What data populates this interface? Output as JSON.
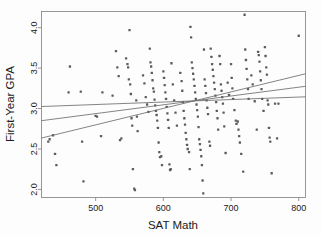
{
  "chart_data": {
    "type": "scatter",
    "title": "",
    "xlabel": "SAT Math",
    "ylabel": "First-Year GPA",
    "xlim": [
      420,
      810
    ],
    "ylim": [
      1.9,
      4.2
    ],
    "xticks": [
      500,
      600,
      700,
      800
    ],
    "yticks": [
      2.0,
      2.5,
      3.0,
      3.5,
      4.0
    ],
    "xtick_labels": [
      "500",
      "600",
      "700",
      "800"
    ],
    "ytick_labels": [
      "2.0",
      "2.5",
      "3.0",
      "3.5",
      "4.0"
    ],
    "grid": false,
    "legend": "none",
    "marker_color": "#5c5c5c",
    "line_color": "#6e6e6e",
    "frame_color": "#8c8c8c",
    "points": [
      [
        430,
        2.59
      ],
      [
        432,
        2.62
      ],
      [
        437,
        2.67
      ],
      [
        440,
        2.44
      ],
      [
        442,
        2.3
      ],
      [
        460,
        3.2
      ],
      [
        462,
        3.52
      ],
      [
        478,
        3.21
      ],
      [
        480,
        2.59
      ],
      [
        482,
        2.1
      ],
      [
        500,
        2.91
      ],
      [
        502,
        2.9
      ],
      [
        508,
        2.66
      ],
      [
        510,
        3.2
      ],
      [
        525,
        3.16
      ],
      [
        530,
        3.71
      ],
      [
        532,
        3.51
      ],
      [
        534,
        3.4
      ],
      [
        536,
        2.61
      ],
      [
        538,
        2.63
      ],
      [
        545,
        3.62
      ],
      [
        547,
        3.55
      ],
      [
        548,
        3.51
      ],
      [
        549,
        3.36
      ],
      [
        550,
        3.97
      ],
      [
        551,
        3.3
      ],
      [
        552,
        3.18
      ],
      [
        553,
        2.88
      ],
      [
        554,
        2.79
      ],
      [
        555,
        2.25
      ],
      [
        557,
        2.01
      ],
      [
        558,
        1.99
      ],
      [
        560,
        3.1
      ],
      [
        561,
        2.9
      ],
      [
        562,
        2.72
      ],
      [
        570,
        3.41
      ],
      [
        572,
        3.31
      ],
      [
        574,
        3.14
      ],
      [
        576,
        3.05
      ],
      [
        578,
        2.96
      ],
      [
        580,
        3.74
      ],
      [
        581,
        3.57
      ],
      [
        582,
        3.52
      ],
      [
        583,
        3.44
      ],
      [
        584,
        3.35
      ],
      [
        585,
        3.25
      ],
      [
        586,
        3.21
      ],
      [
        587,
        3.11
      ],
      [
        588,
        3.04
      ],
      [
        589,
        2.97
      ],
      [
        590,
        2.92
      ],
      [
        591,
        2.85
      ],
      [
        592,
        2.76
      ],
      [
        593,
        2.58
      ],
      [
        594,
        2.46
      ],
      [
        595,
        2.4
      ],
      [
        597,
        2.41
      ],
      [
        598,
        2.3
      ],
      [
        600,
        3.46
      ],
      [
        601,
        3.38
      ],
      [
        602,
        3.29
      ],
      [
        603,
        3.2
      ],
      [
        604,
        3.12
      ],
      [
        605,
        3.02
      ],
      [
        606,
        2.94
      ],
      [
        607,
        2.86
      ],
      [
        608,
        2.76
      ],
      [
        609,
        2.31
      ],
      [
        610,
        2.24
      ],
      [
        611,
        2.25
      ],
      [
        612,
        3.56
      ],
      [
        614,
        3.3
      ],
      [
        616,
        3.1
      ],
      [
        618,
        2.95
      ],
      [
        620,
        2.79
      ],
      [
        625,
        3.44
      ],
      [
        627,
        3.34
      ],
      [
        628,
        3.22
      ],
      [
        629,
        3.08
      ],
      [
        630,
        2.97
      ],
      [
        631,
        2.88
      ],
      [
        632,
        2.8
      ],
      [
        633,
        2.7
      ],
      [
        634,
        2.62
      ],
      [
        635,
        2.55
      ],
      [
        636,
        2.5
      ],
      [
        638,
        2.46
      ],
      [
        639,
        2.25
      ],
      [
        640,
        4.01
      ],
      [
        641,
        3.88
      ],
      [
        642,
        3.57
      ],
      [
        643,
        3.5
      ],
      [
        644,
        3.43
      ],
      [
        645,
        3.36
      ],
      [
        646,
        3.28
      ],
      [
        647,
        3.2
      ],
      [
        648,
        3.12
      ],
      [
        649,
        3.05
      ],
      [
        650,
        2.98
      ],
      [
        651,
        2.9
      ],
      [
        652,
        2.77
      ],
      [
        653,
        2.62
      ],
      [
        654,
        2.56
      ],
      [
        655,
        2.49
      ],
      [
        656,
        2.41
      ],
      [
        657,
        2.3
      ],
      [
        658,
        2.11
      ],
      [
        659,
        1.95
      ],
      [
        660,
        3.73
      ],
      [
        661,
        3.36
      ],
      [
        662,
        3.28
      ],
      [
        663,
        3.19
      ],
      [
        664,
        3.1
      ],
      [
        665,
        3.01
      ],
      [
        666,
        2.93
      ],
      [
        668,
        2.59
      ],
      [
        669,
        2.54
      ],
      [
        670,
        3.74
      ],
      [
        671,
        3.64
      ],
      [
        672,
        3.55
      ],
      [
        673,
        3.48
      ],
      [
        674,
        3.4
      ],
      [
        675,
        3.32
      ],
      [
        676,
        3.24
      ],
      [
        677,
        3.16
      ],
      [
        678,
        3.08
      ],
      [
        679,
        2.97
      ],
      [
        680,
        2.88
      ],
      [
        681,
        2.74
      ],
      [
        683,
        3.65
      ],
      [
        684,
        3.55
      ],
      [
        685,
        3.3
      ],
      [
        686,
        3.22
      ],
      [
        687,
        3.14
      ],
      [
        688,
        3.06
      ],
      [
        689,
        2.95
      ],
      [
        690,
        2.78
      ],
      [
        692,
        2.45
      ],
      [
        695,
        3.32
      ],
      [
        697,
        3.17
      ],
      [
        700,
        3.55
      ],
      [
        701,
        3.38
      ],
      [
        702,
        3.25
      ],
      [
        703,
        3.12
      ],
      [
        705,
        2.98
      ],
      [
        707,
        2.85
      ],
      [
        708,
        2.81
      ],
      [
        710,
        2.84
      ],
      [
        711,
        2.74
      ],
      [
        712,
        2.66
      ],
      [
        713,
        2.58
      ],
      [
        715,
        2.44
      ],
      [
        718,
        2.22
      ],
      [
        720,
        4.16
      ],
      [
        721,
        3.73
      ],
      [
        722,
        3.6
      ],
      [
        723,
        3.49
      ],
      [
        724,
        3.36
      ],
      [
        725,
        3.24
      ],
      [
        726,
        3.12
      ],
      [
        730,
        3.41
      ],
      [
        732,
        3.3
      ],
      [
        735,
        3.09
      ],
      [
        738,
        2.74
      ],
      [
        740,
        3.7
      ],
      [
        741,
        3.66
      ],
      [
        742,
        3.58
      ],
      [
        743,
        3.46
      ],
      [
        744,
        3.35
      ],
      [
        745,
        3.24
      ],
      [
        746,
        3.12
      ],
      [
        748,
        2.97
      ],
      [
        750,
        3.76
      ],
      [
        751,
        3.65
      ],
      [
        752,
        3.51
      ],
      [
        753,
        3.42
      ],
      [
        754,
        3.1
      ],
      [
        755,
        3.05
      ],
      [
        756,
        2.76
      ],
      [
        757,
        2.64
      ],
      [
        758,
        2.59
      ],
      [
        760,
        2.2
      ],
      [
        765,
        3.06
      ],
      [
        768,
        2.63
      ],
      [
        770,
        3.06
      ],
      [
        800,
        3.9
      ]
    ],
    "lines": [
      {
        "name": "flat-fit",
        "x0": 420,
        "y0": 3.025,
        "x1": 810,
        "y1": 3.145
      },
      {
        "name": "middle-fit",
        "x0": 420,
        "y0": 2.85,
        "x1": 810,
        "y1": 3.275
      },
      {
        "name": "steep-fit",
        "x0": 420,
        "y0": 2.635,
        "x1": 810,
        "y1": 3.43
      }
    ]
  }
}
